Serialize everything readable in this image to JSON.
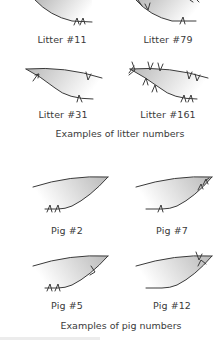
{
  "litter_section": {
    "caption": "Examples of litter numbers",
    "examples": [
      {
        "label": "Litter #11"
      },
      {
        "label": "Litter #79"
      },
      {
        "label": "Litter #31"
      },
      {
        "label": "Litter #161"
      }
    ]
  },
  "pig_section": {
    "caption": "Examples of pig numbers",
    "examples": [
      {
        "label": "Pig #2"
      },
      {
        "label": "Pig #7"
      },
      {
        "label": "Pig #5"
      },
      {
        "label": "Pig #12"
      }
    ]
  },
  "colors": {
    "outline": "#3a3a3a",
    "fill_dark": "#bdbdbd",
    "fill_light": "#ffffff"
  }
}
